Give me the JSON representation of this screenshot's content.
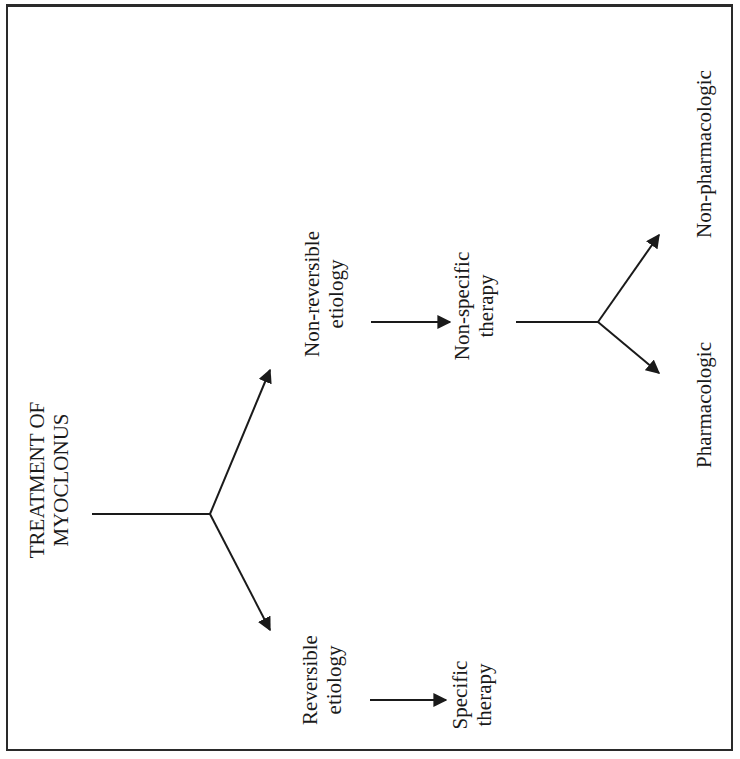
{
  "diagram": {
    "title_line1": "TREATMENT OF",
    "title_line2": "MYOCLONUS",
    "branches": [
      {
        "label_line1": "Reversible",
        "label_line2": "etiology",
        "outcome_line1": "Specific",
        "outcome_line2": "therapy"
      },
      {
        "label_line1": "Non-reversible",
        "label_line2": "etiology",
        "outcome_line1": "Non-specific",
        "outcome_line2": "therapy",
        "sub_options": [
          {
            "label": "Pharmacologic"
          },
          {
            "label": "Non-pharmacologic"
          }
        ]
      }
    ],
    "colors": {
      "ink": "#1a1a1a",
      "border": "#2a2a2a",
      "background": "#ffffff"
    }
  }
}
